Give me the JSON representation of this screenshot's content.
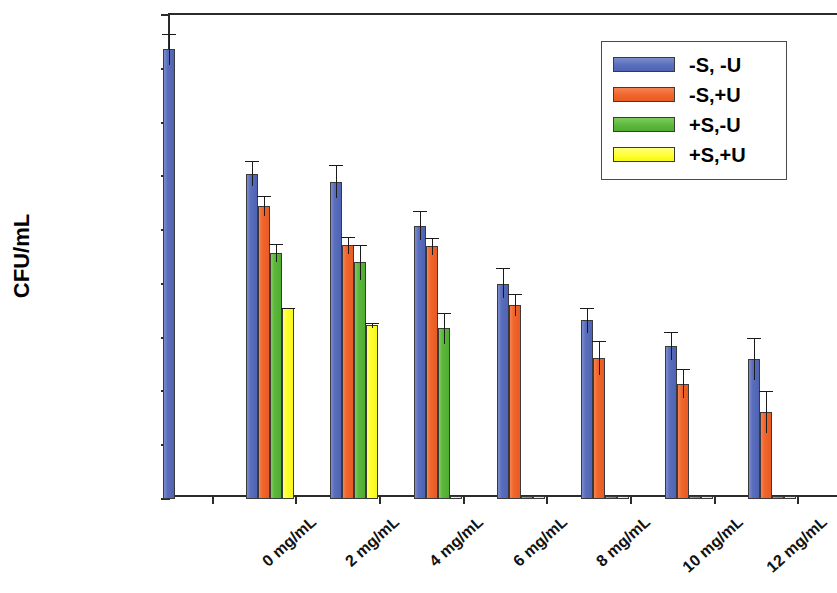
{
  "chart_data": {
    "type": "bar",
    "title": "",
    "xlabel": "",
    "ylabel": "CFU/mL",
    "yscale": "log",
    "ylim": [
      10,
      10000000000
    ],
    "ytick_labels": [
      "1e+10",
      "1e+9",
      "1e+8",
      "1e+7",
      "1e+6",
      "1e+5",
      "1e+4",
      "1e+3",
      "1e+2",
      "1e+1"
    ],
    "ytick_values": [
      10000000000,
      1000000000,
      100000000,
      10000000,
      1000000,
      100000,
      10000,
      1000,
      100,
      10
    ],
    "grid": false,
    "legend_position": "top-right",
    "categories": [
      "0 mg/mL",
      "2 mg/mL",
      "4 mg/mL",
      "6 mg/mL",
      "8 mg/mL",
      "10 mg/mL",
      "12 mg/mL",
      "14 mg/mL"
    ],
    "series": [
      {
        "name": "-S, -U",
        "color": "#5a6ebd",
        "values": [
          2300000000.0,
          11000000.0,
          8000000.0,
          1200000.0,
          100000.0,
          21000.0,
          7000.0,
          4000.0
        ],
        "err_high": [
          4500000000.0,
          19000000.0,
          16000000.0,
          2300000.0,
          200000.0,
          36000.0,
          13000.0,
          10000.0
        ],
        "err_low": [
          1200000000.0,
          6500000.0,
          4000000.0,
          650000.0,
          55000.0,
          12000.0,
          3800.0,
          1600.0
        ]
      },
      {
        "name": "-S,+U",
        "color": "#f0662c",
        "values": [
          null,
          2800000.0,
          520000.0,
          500000.0,
          40000.0,
          4100.0,
          1400.0,
          420.0
        ],
        "err_high": [
          null,
          4300000.0,
          750000.0,
          720000.0,
          65000.0,
          8500.0,
          2600.0,
          1000.0
        ],
        "err_low": [
          null,
          1800000.0,
          360000.0,
          350000.0,
          25000.0,
          2000.0,
          750.0,
          170.0
        ]
      },
      {
        "name": "+S,-U",
        "color": "#5cb83c",
        "values": [
          null,
          380000.0,
          250000.0,
          15000.0,
          11.5,
          11.5,
          11.5,
          11.5
        ],
        "err_high": [
          null,
          560000.0,
          540000.0,
          29000.0,
          null,
          null,
          null,
          null
        ],
        "err_low": [
          null,
          260000.0,
          120000.0,
          7500.0,
          null,
          null,
          null,
          null
        ]
      },
      {
        "name": "+S,+U",
        "color": "#ffff33",
        "values": [
          null,
          35000.0,
          17000.0,
          11.5,
          11.5,
          11.5,
          11.5,
          11.5
        ],
        "err_high": [
          null,
          36000.0,
          19000.0,
          null,
          null,
          null,
          null,
          null
        ],
        "err_low": [
          null,
          34000.0,
          15000.0,
          null,
          null,
          null,
          null,
          null
        ]
      }
    ]
  }
}
